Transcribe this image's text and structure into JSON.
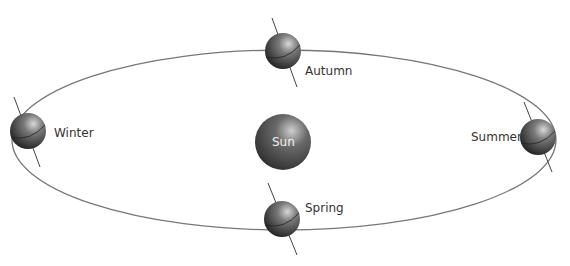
{
  "diagram": {
    "title": "",
    "sun": {
      "label": "Sun"
    },
    "seasons": [
      {
        "label": "Autumn",
        "position": "top"
      },
      {
        "label": "Winter",
        "position": "left"
      },
      {
        "label": "Summer",
        "position": "right"
      },
      {
        "label": "Spring",
        "position": "bottom"
      }
    ],
    "colors": {
      "orbit": "#777777",
      "planet": "#555555",
      "axis": "#444444",
      "label": "#333333"
    }
  }
}
